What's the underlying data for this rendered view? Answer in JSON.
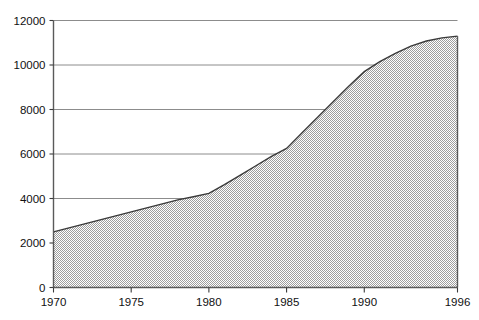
{
  "chart_data": {
    "type": "area",
    "title": "",
    "subtitle": "",
    "xlabel": "",
    "ylabel": "",
    "xlim": [
      1970,
      1996
    ],
    "ylim": [
      0,
      12000
    ],
    "grid": true,
    "legend": "none",
    "fill_pattern": "50% gray checkerboard dither",
    "x_tick_labels": [
      "1970",
      "1975",
      "1980",
      "1985",
      "1990",
      "1996"
    ],
    "x_tick_values": [
      1970,
      1975,
      1980,
      1985,
      1990,
      1996
    ],
    "y_tick_labels": [
      "0",
      "2000",
      "4000",
      "6000",
      "8000",
      "10000",
      "12000"
    ],
    "y_tick_values": [
      0,
      2000,
      4000,
      6000,
      8000,
      10000,
      12000
    ],
    "x": [
      1970,
      1971,
      1972,
      1973,
      1974,
      1975,
      1976,
      1977,
      1978,
      1979,
      1980,
      1981,
      1982,
      1983,
      1984,
      1985,
      1986,
      1987,
      1988,
      1989,
      1990,
      1991,
      1992,
      1993,
      1994,
      1995,
      1996
    ],
    "values": [
      2500,
      2680,
      2860,
      3040,
      3220,
      3400,
      3580,
      3760,
      3940,
      4080,
      4230,
      4620,
      5040,
      5460,
      5880,
      6250,
      6950,
      7650,
      8350,
      9050,
      9700,
      10150,
      10520,
      10850,
      11080,
      11220,
      11300
    ],
    "series": [
      {
        "name": "series-1",
        "values": [
          2500,
          2680,
          2860,
          3040,
          3220,
          3400,
          3580,
          3760,
          3940,
          4080,
          4230,
          4620,
          5040,
          5460,
          5880,
          6250,
          6950,
          7650,
          8350,
          9050,
          9700,
          10150,
          10520,
          10850,
          11080,
          11220,
          11300
        ]
      }
    ],
    "colors": {
      "area_fill": "#9e9e9e",
      "line": "#3a3a3a",
      "axis": "#5a5a5a",
      "grid": "#8c8c8c",
      "background": "#ffffff",
      "text": "#111111"
    }
  }
}
